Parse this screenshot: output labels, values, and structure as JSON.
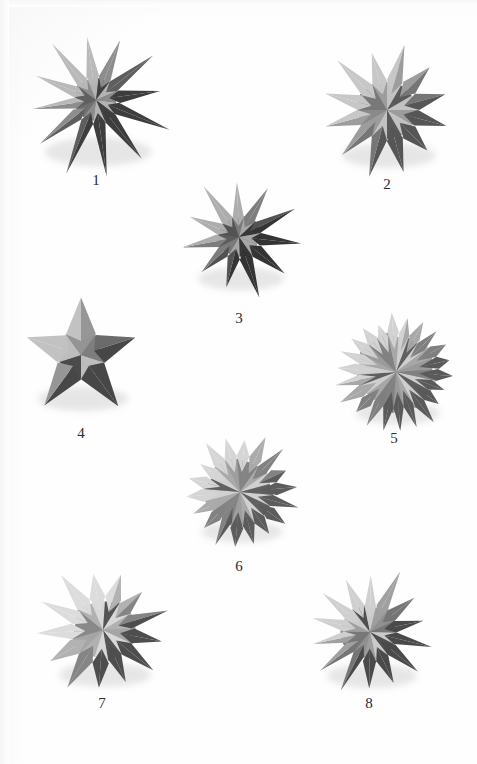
{
  "plate": {
    "kind": "photographic-plate",
    "background_color": "#fefefe",
    "ink_color": "#2b2b2b",
    "width": 477,
    "height": 764,
    "figure_count": 8
  },
  "figures": [
    {
      "caption": "1",
      "name": "stellated-polyhedron-1",
      "description": "final stellation of the icosahedron, twelve long spikes, dark grey shading",
      "center_x": 96,
      "center_y": 100,
      "radius": 72,
      "spikes": 12,
      "inner_ratio": 0.3,
      "rotation": -8,
      "caption_x": 96,
      "caption_y": 180,
      "palette": {
        "light": "#b9b9b9",
        "mid": "#8d8d8d",
        "dark": "#5e5e5e",
        "darkest": "#3d3d3d",
        "core": "#6f6f6f"
      }
    },
    {
      "caption": "2",
      "name": "stellated-polyhedron-2",
      "description": "great stellated dodecahedron, twelve short broad pyramids, mid grey",
      "center_x": 387,
      "center_y": 110,
      "radius": 63,
      "spikes": 12,
      "inner_ratio": 0.46,
      "rotation": 15,
      "caption_x": 387,
      "caption_y": 184,
      "palette": {
        "light": "#c7c7c7",
        "mid": "#9d9d9d",
        "dark": "#767676",
        "darkest": "#565656",
        "core": "#8a8a8a"
      }
    },
    {
      "caption": "3",
      "name": "stellated-polyhedron-3",
      "description": "small stellated dodecahedron, twelve sharp pyramids, dark shading",
      "center_x": 239,
      "center_y": 237,
      "radius": 58,
      "spikes": 11,
      "inner_ratio": 0.36,
      "rotation": 6,
      "caption_x": 239,
      "caption_y": 318,
      "palette": {
        "light": "#adadad",
        "mid": "#7d7d7d",
        "dark": "#525252",
        "darkest": "#343434",
        "core": "#5d5d5d"
      }
    },
    {
      "caption": "4",
      "name": "stellated-polyhedron-4",
      "description": "excavated hexagonal solid showing a five-point star face, broad flat model",
      "center_x": 81,
      "center_y": 355,
      "radius": 61,
      "spikes": 5,
      "inner_ratio": 0.4,
      "rotation": -18,
      "caption_x": 81,
      "caption_y": 433,
      "palette": {
        "light": "#c2c2c2",
        "mid": "#969696",
        "dark": "#6b6b6b",
        "darkest": "#474747",
        "core": "#7e7e7e"
      }
    },
    {
      "caption": "5",
      "name": "stellated-polyhedron-5",
      "description": "complex many-faceted stellation, numerous small pyramids, light grey",
      "center_x": 396,
      "center_y": 372,
      "radius": 57,
      "spikes": 22,
      "inner_ratio": 0.66,
      "rotation": 4,
      "caption_x": 394,
      "caption_y": 438,
      "palette": {
        "light": "#d2d2d2",
        "mid": "#a8a8a8",
        "dark": "#7f7f7f",
        "darkest": "#5a5a5a",
        "core": "#9a9a9a"
      }
    },
    {
      "caption": "6",
      "name": "stellated-polyhedron-6",
      "description": "stellated icosahedron with many short triangular pyramids, pale grey",
      "center_x": 240,
      "center_y": 492,
      "radius": 55,
      "spikes": 18,
      "inner_ratio": 0.6,
      "rotation": -5,
      "caption_x": 239,
      "caption_y": 566,
      "palette": {
        "light": "#d5d5d5",
        "mid": "#ababab",
        "dark": "#828282",
        "darkest": "#5c5c5c",
        "core": "#9e9e9e"
      }
    },
    {
      "caption": "7",
      "name": "stellated-polyhedron-7",
      "description": "compound stellation with broad pale spikes and dark recesses",
      "center_x": 103,
      "center_y": 630,
      "radius": 62,
      "spikes": 13,
      "inner_ratio": 0.48,
      "rotation": 11,
      "caption_x": 102,
      "caption_y": 703,
      "palette": {
        "light": "#dcdcdc",
        "mid": "#b2b2b2",
        "dark": "#858585",
        "darkest": "#4e4e4e",
        "core": "#a5a5a5"
      }
    },
    {
      "caption": "8",
      "name": "stellated-polyhedron-8",
      "description": "compound of spiky tetrahedral forms, medium grey with deep shadows",
      "center_x": 370,
      "center_y": 632,
      "radius": 61,
      "spikes": 14,
      "inner_ratio": 0.44,
      "rotation": -12,
      "caption_x": 369,
      "caption_y": 703,
      "palette": {
        "light": "#cfcfcf",
        "mid": "#a0a0a0",
        "dark": "#757575",
        "darkest": "#4a4a4a",
        "core": "#909090"
      }
    }
  ]
}
